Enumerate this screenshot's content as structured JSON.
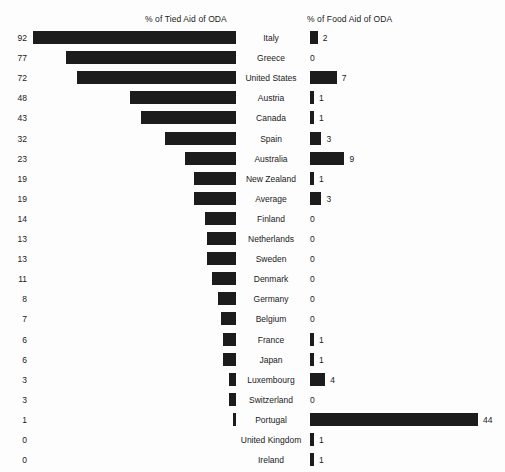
{
  "chart_data": {
    "type": "bar",
    "title": "",
    "subtitle": "",
    "orientation": "horizontal-diverging",
    "categories": [
      "Italy",
      "Greece",
      "United States",
      "Austria",
      "Canada",
      "Spain",
      "Australia",
      "New Zealand",
      "Average",
      "Finland",
      "Netherlands",
      "Sweden",
      "Denmark",
      "Germany",
      "Belgium",
      "France",
      "Japan",
      "Luxembourg",
      "Switzerland",
      "Portugal",
      "United Kingdom",
      "Ireland"
    ],
    "series": [
      {
        "name": "% of Tied Aid of ODA",
        "side": "left",
        "values": [
          92,
          77,
          72,
          48,
          43,
          32,
          23,
          19,
          19,
          14,
          13,
          13,
          11,
          8,
          7,
          6,
          6,
          3,
          3,
          1,
          0,
          0
        ]
      },
      {
        "name": "% of Food Aid of ODA",
        "side": "right",
        "values": [
          2,
          0,
          7,
          1,
          1,
          3,
          9,
          1,
          3,
          0,
          0,
          0,
          0,
          0,
          0,
          1,
          1,
          4,
          0,
          44,
          1,
          1
        ]
      }
    ],
    "left_axis_label": "% of Tied Aid of ODA",
    "right_axis_label": "% of Food Aid of ODA",
    "xlabel": "",
    "ylabel": "",
    "left_xlim": [
      0,
      92
    ],
    "right_xlim": [
      0,
      44
    ],
    "grid": false,
    "legend": "none",
    "bar_color": "#1c1c1c",
    "background_color": "#fdfdfd"
  },
  "headers": {
    "left": "% of Tied Aid of ODA",
    "right": "% of Food Aid of ODA"
  },
  "rows": [
    {
      "country": "Italy",
      "tied": "92",
      "food": "2"
    },
    {
      "country": "Greece",
      "tied": "77",
      "food": "0"
    },
    {
      "country": "United States",
      "tied": "72",
      "food": "7"
    },
    {
      "country": "Austria",
      "tied": "48",
      "food": "1"
    },
    {
      "country": "Canada",
      "tied": "43",
      "food": "1"
    },
    {
      "country": "Spain",
      "tied": "32",
      "food": "3"
    },
    {
      "country": "Australia",
      "tied": "23",
      "food": "9"
    },
    {
      "country": "New Zealand",
      "tied": "19",
      "food": "1"
    },
    {
      "country": "Average",
      "tied": "19",
      "food": "3"
    },
    {
      "country": "Finland",
      "tied": "14",
      "food": "0"
    },
    {
      "country": "Netherlands",
      "tied": "13",
      "food": "0"
    },
    {
      "country": "Sweden",
      "tied": "13",
      "food": "0"
    },
    {
      "country": "Denmark",
      "tied": "11",
      "food": "0"
    },
    {
      "country": "Germany",
      "tied": "8",
      "food": "0"
    },
    {
      "country": "Belgium",
      "tied": "7",
      "food": "0"
    },
    {
      "country": "France",
      "tied": "6",
      "food": "1"
    },
    {
      "country": "Japan",
      "tied": "6",
      "food": "1"
    },
    {
      "country": "Luxembourg",
      "tied": "3",
      "food": "4"
    },
    {
      "country": "Switzerland",
      "tied": "3",
      "food": "0"
    },
    {
      "country": "Portugal",
      "tied": "1",
      "food": "44"
    },
    {
      "country": "United Kingdom",
      "tied": "0",
      "food": "1"
    },
    {
      "country": "Ireland",
      "tied": "0",
      "food": "1"
    }
  ]
}
